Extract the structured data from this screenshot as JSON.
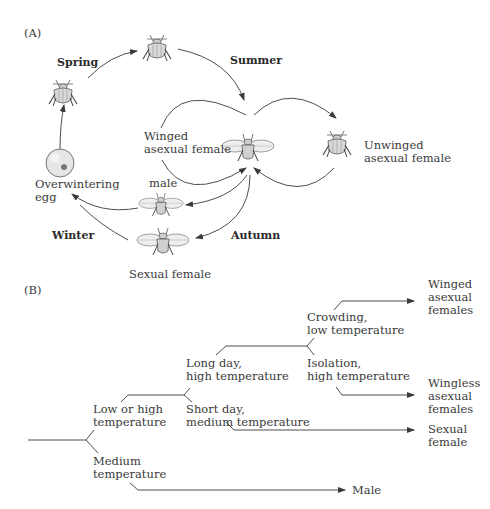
{
  "panel_a": {
    "label": "(A)",
    "seasons": {
      "spring": "Spring",
      "summer": "Summer",
      "autumn": "Autumn",
      "winter": "Winter"
    },
    "stages": {
      "egg": [
        "Overwintering",
        "egg"
      ],
      "winged_asexual": [
        "Winged",
        "asexual female"
      ],
      "unwinged_asexual": [
        "Unwinged",
        "asexual female"
      ],
      "male": "male",
      "sexual_female": "Sexual female"
    }
  },
  "panel_b": {
    "label": "(B)",
    "conditions": {
      "low_or_high": [
        "Low or high",
        "temperature"
      ],
      "medium": [
        "Medium",
        "temperature"
      ],
      "long_day": [
        "Long day,",
        "high temperature"
      ],
      "short_day": [
        "Short day,",
        "medium temperature"
      ],
      "crowding": [
        "Crowding,",
        "low temperature"
      ],
      "isolation": [
        "Isolation,",
        "high temperature"
      ]
    },
    "outcomes": {
      "winged": [
        "Winged",
        "asexual",
        "females"
      ],
      "wingless": [
        "Wingless",
        "asexual",
        "females"
      ],
      "sexual": [
        "Sexual",
        "female"
      ],
      "male": "Male"
    }
  },
  "colors": {
    "line": "#3a3a3a",
    "insect_fill": "#d6d6d6",
    "insect_stroke": "#5a5a5a",
    "egg_fill": "#e6e6e6"
  }
}
